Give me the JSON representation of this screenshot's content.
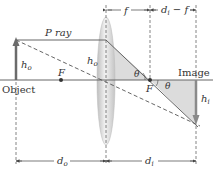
{
  "diagram": {
    "type": "thin-lens ray diagram",
    "colors": {
      "axis": "#555555",
      "object_arrow": "#6b6b6b",
      "ray": "#555555",
      "shade": "#d9d9d9",
      "lens": "#cfcfcf",
      "focal_point": "#333333"
    },
    "labels": {
      "p_ray": "P ray",
      "object": "Object",
      "image": "Image",
      "h_o_object": "h",
      "h_o_object_sub": "o",
      "h_o_lens": "h",
      "h_o_lens_sub": "o",
      "h_i": "h",
      "h_i_sub": "i",
      "focal_left": "F",
      "focal_right": "F",
      "theta_left": "θ",
      "theta_right": "θ",
      "dim_f": "f",
      "dim_di_minus_f_d": "d",
      "dim_di_minus_f_sub": "i",
      "dim_di_minus_f_rest": " − f",
      "dim_do": "d",
      "dim_do_sub": "o",
      "dim_di": "d",
      "dim_di_sub": "i"
    }
  }
}
